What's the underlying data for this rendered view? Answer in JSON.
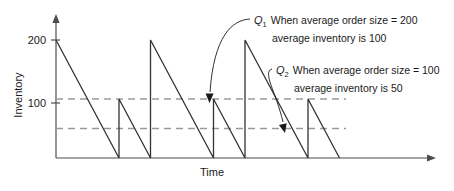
{
  "chart_data": {
    "type": "line",
    "title": "",
    "xlabel": "Time",
    "ylabel": "Inventory",
    "ylim": [
      0,
      230
    ],
    "xlim": [
      0,
      8
    ],
    "ytick_labels": [
      "200",
      "100"
    ],
    "ytick_values": [
      200,
      100
    ],
    "grid": false,
    "legend_position": "none",
    "reference_lines": [
      {
        "name": "average-inventory-100",
        "value": 100,
        "style": "dashed"
      },
      {
        "name": "average-inventory-50",
        "value": 50,
        "style": "dashed"
      }
    ],
    "series": [
      {
        "name": "Inventory level over time (sawtooth)",
        "points": [
          {
            "x": 0.0,
            "y": 200
          },
          {
            "x": 2.0,
            "y": 0
          },
          {
            "x": 2.0,
            "y": 100
          },
          {
            "x": 3.0,
            "y": 0
          },
          {
            "x": 3.0,
            "y": 200
          },
          {
            "x": 5.0,
            "y": 0
          },
          {
            "x": 5.0,
            "y": 100
          },
          {
            "x": 6.0,
            "y": 0
          },
          {
            "x": 6.0,
            "y": 200
          },
          {
            "x": 8.0,
            "y": 0
          },
          {
            "x": 8.0,
            "y": 100
          },
          {
            "x": 9.0,
            "y": 0
          }
        ]
      }
    ],
    "annotations": [
      {
        "id": "Q1",
        "symbol": "Q",
        "subscript": "1",
        "line1": "When average order size = 200",
        "line2": "average inventory is 100",
        "order_size": 200,
        "average_inventory": 100,
        "points_to": {
          "x": 3.0,
          "y": 100
        }
      },
      {
        "id": "Q2",
        "symbol": "Q",
        "subscript": "2",
        "line1": "When average order size = 100",
        "line2": "average inventory is 50",
        "order_size": 100,
        "average_inventory": 50,
        "points_to": {
          "x": 5.4,
          "y": 50
        }
      }
    ],
    "colors": {
      "series": "#333333",
      "reference": "#9a9a9a",
      "axis": "#4d4d4d",
      "text": "#1a1a1a",
      "background": "#ffffff"
    }
  }
}
